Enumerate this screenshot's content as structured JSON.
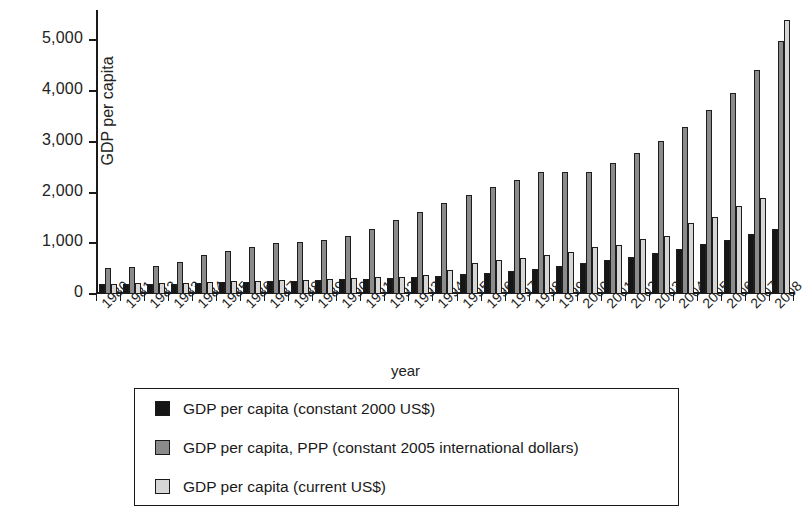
{
  "chart_data": {
    "type": "bar",
    "title": "",
    "xlabel": "year",
    "ylabel": "GDP per capita",
    "ylim": [
      0,
      5600
    ],
    "yticks": [
      0,
      1000,
      2000,
      3000,
      4000,
      5000
    ],
    "ytick_labels": [
      "0",
      "1,000",
      "2,000",
      "3,000",
      "4,000",
      "5,000"
    ],
    "grid": false,
    "legend_position": "below-axes",
    "categories": [
      "1980",
      "1981",
      "1982",
      "1983",
      "1984",
      "1985",
      "1986",
      "1987",
      "1988",
      "1989",
      "1990",
      "1991",
      "1992",
      "1993",
      "1994",
      "1995",
      "1996",
      "1997",
      "1998",
      "1999",
      "2000",
      "2001",
      "2002",
      "2003",
      "2004",
      "2005",
      "2006",
      "2007",
      "2008"
    ],
    "series": [
      {
        "name": "GDP per capita (constant 2000 US$)",
        "color": "#161616",
        "values": [
          190,
          190,
          195,
          200,
          215,
          230,
          240,
          250,
          265,
          275,
          290,
          300,
          320,
          330,
          360,
          390,
          420,
          460,
          500,
          560,
          610,
          670,
          730,
          800,
          880,
          980,
          1070,
          1180,
          1280
        ]
      },
      {
        "name": "GDP per capita, PPP (constant 2005 international dollars)",
        "color": "#8b8b8b",
        "values": [
          520,
          530,
          560,
          630,
          760,
          840,
          920,
          1010,
          1030,
          1060,
          1140,
          1290,
          1460,
          1620,
          1800,
          1960,
          2110,
          2250,
          2400,
          2400,
          2400,
          2580,
          2780,
          3020,
          3290,
          3620,
          3970,
          4420,
          4990
        ]
      },
      {
        "name": "GDP per capita (current US$)",
        "color": "#d6d6d6",
        "values": [
          200,
          210,
          210,
          220,
          240,
          250,
          260,
          270,
          280,
          290,
          320,
          340,
          330,
          370,
          480,
          610,
          680,
          720,
          760,
          830,
          920,
          960,
          1090,
          1150,
          1410,
          1520,
          1740,
          1900,
          2470
        ]
      }
    ],
    "note_highest_bar": {
      "series": "GDP per capita (current US$)",
      "year": "2008",
      "value": 5400
    }
  },
  "axes": {
    "y_title": "GDP per capita",
    "x_title": "year"
  },
  "legend": {
    "entries": [
      {
        "swatch": "black-swatch",
        "label": "GDP per capita (constant 2000 US$)"
      },
      {
        "swatch": "gray-swatch",
        "label": "GDP per capita, PPP (constant 2005 international dollars)"
      },
      {
        "swatch": "light-gray-swatch",
        "label": "GDP per capita (current US$)"
      }
    ]
  }
}
